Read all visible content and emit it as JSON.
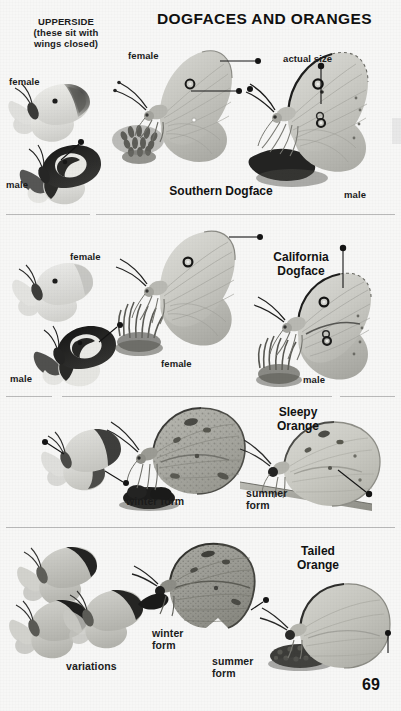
{
  "page": {
    "title": "DOGFACES AND ORANGES",
    "page_number": "69",
    "background_color": "#f7f7f6",
    "text_color": "#1b1b1b"
  },
  "header": {
    "upperside_note": "UPPERSIDE\n(these sit with\nwings closed)"
  },
  "sections": [
    {
      "id": "southern-dogface",
      "species_name": "Southern Dogface",
      "scale_note": "actual size",
      "labels": [
        {
          "text": "female",
          "role": "upperside-female"
        },
        {
          "text": "male",
          "role": "upperside-male"
        },
        {
          "text": "female",
          "role": "side-female"
        },
        {
          "text": "male",
          "role": "side-male"
        }
      ]
    },
    {
      "id": "california-dogface",
      "species_name": "California\nDogface",
      "labels": [
        {
          "text": "female",
          "role": "upperside-female"
        },
        {
          "text": "male",
          "role": "upperside-male"
        },
        {
          "text": "female",
          "role": "side-female"
        },
        {
          "text": "male",
          "role": "side-male"
        }
      ]
    },
    {
      "id": "sleepy-orange",
      "species_name": "Sleepy\nOrange",
      "labels": [
        {
          "text": "winter form",
          "role": "winter-form"
        },
        {
          "text": "summer\nform",
          "role": "summer-form"
        }
      ]
    },
    {
      "id": "tailed-orange",
      "species_name": "Tailed\nOrange",
      "labels": [
        {
          "text": "variations",
          "role": "variations"
        },
        {
          "text": "winter\nform",
          "role": "winter-form"
        },
        {
          "text": "summer\nform",
          "role": "summer-form"
        }
      ]
    }
  ]
}
